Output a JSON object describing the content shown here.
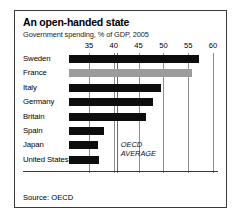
{
  "figure": {
    "title": "An open-handed state",
    "subtitle": "Government spending, % of GDP, 2005",
    "source": "Source: OECD",
    "oecd_caption_line1": "OECD",
    "oecd_caption_line2": "AVERAGE",
    "bar_color": "#0d0d0d",
    "highlight_color": "#9b9b9b",
    "gridline_color": "#8d8d8d",
    "border_color": "#3a3a3a"
  },
  "chart_data": {
    "type": "bar",
    "orientation": "horizontal",
    "title": "An open-handed state",
    "subtitle": "Government spending, % of GDP, 2005",
    "xlabel": "",
    "ylabel": "",
    "xlim": [
      33,
      61
    ],
    "xticks": [
      35,
      40,
      45,
      50,
      55,
      60
    ],
    "xticklabels": [
      "35",
      "40",
      "45",
      "50",
      "55",
      "60"
    ],
    "grid": true,
    "legend": null,
    "categories": [
      "Sweden",
      "France",
      "Italy",
      "Germany",
      "Britain",
      "Spain",
      "Japan",
      "United States"
    ],
    "values": [
      57.2,
      55.8,
      49.6,
      47.9,
      46.5,
      38.1,
      36.9,
      37.1
    ],
    "highlighted": [
      "France"
    ],
    "annotations": [
      {
        "label": "OECD AVERAGE",
        "type": "vline",
        "value": 40.6
      }
    ],
    "source": "Source: OECD"
  }
}
